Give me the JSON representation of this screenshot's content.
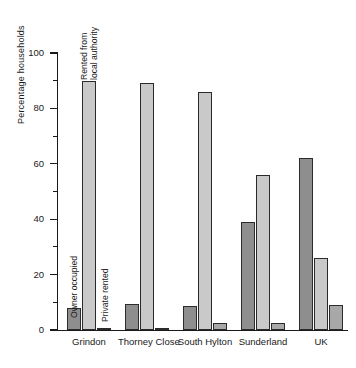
{
  "chart_data": {
    "type": "bar",
    "title": "",
    "subtitle": "",
    "xlabel": "",
    "ylabel": "Percentage households",
    "ylim": [
      0,
      100
    ],
    "yticks": [
      0,
      20,
      40,
      60,
      80,
      100
    ],
    "ytick_labels": [
      "0",
      "20",
      "40",
      "60",
      "80",
      "100"
    ],
    "yminor_ticks": [
      10,
      30,
      50,
      70,
      90
    ],
    "grid": false,
    "legend_position": "in-plot-annotations",
    "categories": [
      "Grindon",
      "Thorney Close",
      "South Hylton",
      "Sunderland",
      "UK"
    ],
    "series": [
      {
        "name": "Owner occupied",
        "color": "#8e8e8e",
        "values": [
          8,
          9.5,
          8.5,
          39,
          62
        ]
      },
      {
        "name": "Rented from local authority",
        "color": "#c9c9c9",
        "values": [
          90,
          89,
          86,
          56,
          26
        ]
      },
      {
        "name": "Private rented",
        "color": "#a8a8a8",
        "values": [
          0.3,
          0.8,
          2.5,
          2.5,
          9
        ]
      }
    ],
    "annotations": [
      {
        "text": "Owner occupied",
        "series": "Owner occupied",
        "category": "Grindon"
      },
      {
        "text": "Rented from local authority",
        "series": "Rented from local authority",
        "category": "Grindon"
      },
      {
        "text": "Private rented",
        "series": "Private rented",
        "category": "Grindon"
      }
    ]
  },
  "axis": {
    "y_title": "Percentage households"
  },
  "annotation_text": {
    "owner_occupied": "Owner occupied",
    "rented_line1": "Rented from",
    "rented_line2": "local authority",
    "private_rented": "Private rented"
  }
}
